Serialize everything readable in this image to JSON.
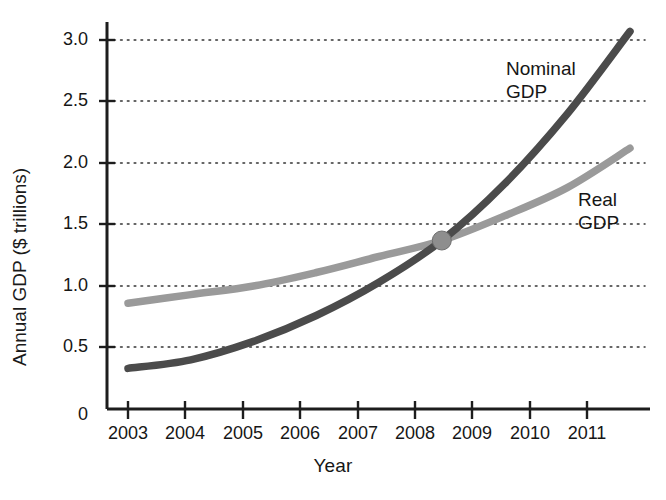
{
  "chart_data": {
    "type": "line",
    "title": "",
    "xlabel": "Year",
    "ylabel": "Annual GDP ($ trillions)",
    "x": [
      2003,
      2004,
      2005,
      2006,
      2007,
      2008,
      2009,
      2010,
      2011
    ],
    "xlim": [
      2002.6,
      2011.0
    ],
    "ylim": [
      0,
      3.15
    ],
    "yticks": [
      0,
      0.5,
      1.0,
      1.5,
      2.0,
      2.5,
      3.0
    ],
    "ytick_labels": [
      "0",
      "0.5",
      "1.0",
      "1.5",
      "2.0",
      "2.5",
      "3.0"
    ],
    "xtick_labels": [
      "2003",
      "2004",
      "2005",
      "2006",
      "2007",
      "2008",
      "2009",
      "2010",
      "2011"
    ],
    "grid": "horizontal-dotted",
    "legend_position": "inline-labels",
    "series": [
      {
        "name": "Nominal GDP",
        "color": "#4b4b4b",
        "values": [
          0.33,
          0.4,
          0.55,
          0.76,
          1.03,
          1.37,
          1.83,
          2.4,
          3.07
        ]
      },
      {
        "name": "Real GDP",
        "color": "#9a9a9a",
        "values": [
          0.86,
          0.93,
          1.0,
          1.11,
          1.24,
          1.37,
          1.57,
          1.8,
          2.12
        ]
      }
    ],
    "annotations": [
      {
        "name": "intersection-marker",
        "x": 2008,
        "y": 1.37,
        "shape": "circle",
        "color": "#8e8e8e"
      }
    ]
  },
  "labels": {
    "y_axis_title": "Annual GDP ($ trillions)",
    "x_axis_title": "Year",
    "nominal_line1": "Nominal",
    "nominal_line2": "GDP",
    "real_line1": "Real",
    "real_line2": "GDP"
  },
  "colors": {
    "nominal": "#4b4b4b",
    "real": "#9a9a9a",
    "axis": "#1d1d1d",
    "grid": "#3a3a3a",
    "marker": "#8e8e8e",
    "background": "#ffffff"
  }
}
